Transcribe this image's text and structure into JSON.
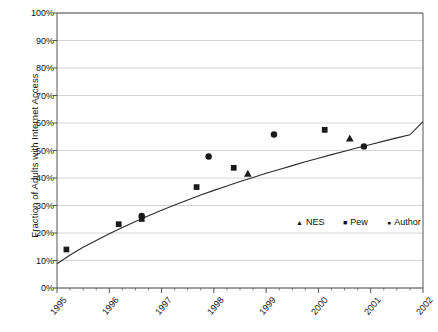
{
  "chart_data": {
    "type": "scatter",
    "title": "",
    "xlabel": "",
    "ylabel": "Fraction of Adults with Internet Access",
    "xlim": [
      1995,
      2002
    ],
    "ylim": [
      0,
      1
    ],
    "grid": true,
    "legend_position": "middle-right-inside",
    "x_ticks": [
      "1995",
      "1996",
      "1997",
      "1998",
      "1999",
      "2000",
      "2001",
      "2002"
    ],
    "y_ticks": [
      "0%",
      "10%",
      "20%",
      "30%",
      "40%",
      "50%",
      "60%",
      "70%",
      "80%",
      "90%",
      "100%"
    ],
    "legend": [
      {
        "name": "NES",
        "marker": "triangle"
      },
      {
        "name": "Pew",
        "marker": "square"
      },
      {
        "name": "Author",
        "marker": "circle"
      }
    ],
    "series": [
      {
        "name": "NES",
        "marker": "triangle",
        "points": [
          {
            "x": 1998.65,
            "y": 0.415
          },
          {
            "x": 2000.6,
            "y": 0.543
          }
        ]
      },
      {
        "name": "Pew",
        "marker": "square",
        "points": [
          {
            "x": 1995.18,
            "y": 0.14
          },
          {
            "x": 1996.18,
            "y": 0.232
          },
          {
            "x": 1996.62,
            "y": 0.251
          },
          {
            "x": 1997.67,
            "y": 0.367
          },
          {
            "x": 1998.38,
            "y": 0.437
          },
          {
            "x": 2000.12,
            "y": 0.575
          }
        ]
      },
      {
        "name": "Author",
        "marker": "circle",
        "points": [
          {
            "x": 1996.62,
            "y": 0.262
          },
          {
            "x": 1997.9,
            "y": 0.478
          },
          {
            "x": 1999.15,
            "y": 0.558
          },
          {
            "x": 2000.87,
            "y": 0.515
          }
        ]
      }
    ],
    "fitted_curve": {
      "name": "fitted trend",
      "points": [
        {
          "x": 1995.0,
          "y": 0.088
        },
        {
          "x": 1995.25,
          "y": 0.12
        },
        {
          "x": 1995.5,
          "y": 0.148
        },
        {
          "x": 1995.75,
          "y": 0.173
        },
        {
          "x": 1996.0,
          "y": 0.197
        },
        {
          "x": 1996.25,
          "y": 0.22
        },
        {
          "x": 1996.5,
          "y": 0.242
        },
        {
          "x": 1996.75,
          "y": 0.263
        },
        {
          "x": 1997.0,
          "y": 0.283
        },
        {
          "x": 1997.25,
          "y": 0.302
        },
        {
          "x": 1997.5,
          "y": 0.32
        },
        {
          "x": 1997.75,
          "y": 0.338
        },
        {
          "x": 1998.0,
          "y": 0.355
        },
        {
          "x": 1998.25,
          "y": 0.371
        },
        {
          "x": 1998.5,
          "y": 0.387
        },
        {
          "x": 1998.75,
          "y": 0.402
        },
        {
          "x": 1999.0,
          "y": 0.417
        },
        {
          "x": 1999.25,
          "y": 0.431
        },
        {
          "x": 1999.5,
          "y": 0.445
        },
        {
          "x": 1999.75,
          "y": 0.459
        },
        {
          "x": 2000.0,
          "y": 0.472
        },
        {
          "x": 2000.25,
          "y": 0.485
        },
        {
          "x": 2000.5,
          "y": 0.497
        },
        {
          "x": 2000.75,
          "y": 0.51
        },
        {
          "x": 2001.0,
          "y": 0.522
        },
        {
          "x": 2001.25,
          "y": 0.534
        },
        {
          "x": 2001.5,
          "y": 0.546
        },
        {
          "x": 2001.75,
          "y": 0.557
        },
        {
          "x": 2002.0,
          "y": 0.605
        }
      ]
    },
    "colors": {
      "marker": "#1a1a1a",
      "curve": "#2b2b2b",
      "grid": "#c9c9c9",
      "axis": "#555555",
      "background": "#ffffff"
    }
  }
}
